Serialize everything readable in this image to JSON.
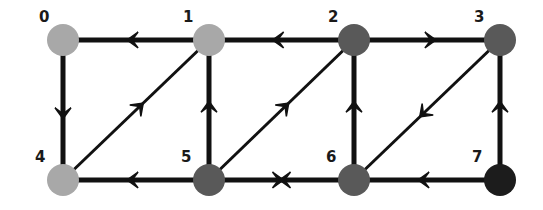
{
  "diagram": {
    "type": "directed-graph",
    "node_radius": 16,
    "nodes": [
      {
        "id": "0",
        "label": "0",
        "x": 63,
        "y": 40,
        "color": "#a8a8a8",
        "label_dx": -24,
        "label_dy": -18
      },
      {
        "id": "1",
        "label": "1",
        "x": 209,
        "y": 40,
        "color": "#a8a8a8",
        "label_dx": -26,
        "label_dy": -18
      },
      {
        "id": "2",
        "label": "2",
        "x": 354,
        "y": 40,
        "color": "#595959",
        "label_dx": -26,
        "label_dy": -18
      },
      {
        "id": "3",
        "label": "3",
        "x": 500,
        "y": 40,
        "color": "#595959",
        "label_dx": -26,
        "label_dy": -18
      },
      {
        "id": "4",
        "label": "4",
        "x": 63,
        "y": 180,
        "color": "#a8a8a8",
        "label_dx": -28,
        "label_dy": -18
      },
      {
        "id": "5",
        "label": "5",
        "x": 209,
        "y": 180,
        "color": "#595959",
        "label_dx": -28,
        "label_dy": -18
      },
      {
        "id": "6",
        "label": "6",
        "x": 354,
        "y": 180,
        "color": "#595959",
        "label_dx": -28,
        "label_dy": -18
      },
      {
        "id": "7",
        "label": "7",
        "x": 500,
        "y": 180,
        "color": "#1c1c1c",
        "label_dx": -28,
        "label_dy": -18
      }
    ],
    "edges": [
      {
        "from": "1",
        "to": "0",
        "style": "straight"
      },
      {
        "from": "2",
        "to": "1",
        "style": "straight"
      },
      {
        "from": "2",
        "to": "3",
        "style": "straight"
      },
      {
        "from": "0",
        "to": "4",
        "style": "straight"
      },
      {
        "from": "4",
        "to": "1",
        "style": "diagonal"
      },
      {
        "from": "5",
        "to": "1",
        "style": "straight"
      },
      {
        "from": "5",
        "to": "2",
        "style": "diagonal"
      },
      {
        "from": "6",
        "to": "2",
        "style": "straight"
      },
      {
        "from": "3",
        "to": "6",
        "style": "diagonal"
      },
      {
        "from": "7",
        "to": "3",
        "style": "straight"
      },
      {
        "from": "5",
        "to": "4",
        "style": "straight"
      },
      {
        "from": "5",
        "to": "6",
        "style": "straight",
        "bidirectional_meeting": true
      },
      {
        "from": "6",
        "to": "5",
        "style": "straight",
        "bidirectional_meeting": true
      },
      {
        "from": "7",
        "to": "6",
        "style": "straight"
      }
    ],
    "colors": {
      "edge": "#111111",
      "light_node": "#a8a8a8",
      "mid_node": "#595959",
      "dark_node": "#1c1c1c",
      "background": "#ffffff"
    }
  }
}
